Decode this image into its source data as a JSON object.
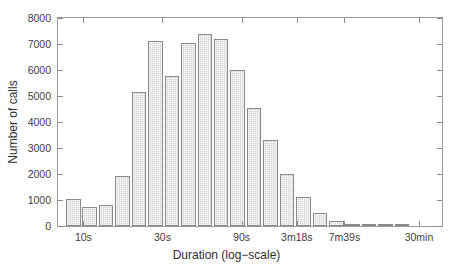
{
  "chart_data": {
    "type": "bar",
    "title": "",
    "subtitle": "",
    "xlabel": "Duration (log−scale)",
    "ylabel": "Number of calls",
    "grid": false,
    "legend": null,
    "legend_position": "none",
    "ylim": [
      0,
      8000
    ],
    "ytick_values": [
      0,
      1000,
      2000,
      3000,
      4000,
      5000,
      6000,
      7000,
      8000
    ],
    "ytick_labels": [
      "0",
      "1000",
      "2000",
      "3000",
      "4000",
      "5000",
      "6000",
      "7000",
      "8000"
    ],
    "xtick_labels": [
      "10s",
      "30s",
      "90s",
      "3m18s",
      "7m39s",
      "30min"
    ],
    "xtick_positions_pct": [
      6.6,
      27.2,
      47.8,
      62.2,
      74.6,
      94.0
    ],
    "x_scale": "log",
    "bar_count": 22,
    "categories": [
      "bin-1",
      "bin-2",
      "bin-3",
      "bin-4",
      "bin-5",
      "bin-6",
      "bin-7",
      "bin-8",
      "bin-9",
      "bin-10",
      "bin-11",
      "bin-12",
      "bin-13",
      "bin-14",
      "bin-15",
      "bin-16",
      "bin-17",
      "bin-18",
      "bin-19",
      "bin-20",
      "bin-21",
      "bin-22"
    ],
    "values": [
      1050,
      720,
      820,
      1920,
      5140,
      7120,
      5770,
      7050,
      7400,
      7200,
      6010,
      4530,
      3300,
      2000,
      1100,
      490,
      190,
      60,
      20,
      8,
      4,
      0
    ],
    "bar_color": "#d6d6d6",
    "bar_edge_color": "#8a8a8a",
    "axis_color": "#8a8a8a",
    "text_color": "#3c3c3c",
    "background_color": "#ffffff",
    "bar_left_pct": 2.1,
    "bar_pitch_pct": 4.28,
    "bar_width_pct": 3.78
  },
  "figure": {
    "width": 467,
    "height": 268
  }
}
